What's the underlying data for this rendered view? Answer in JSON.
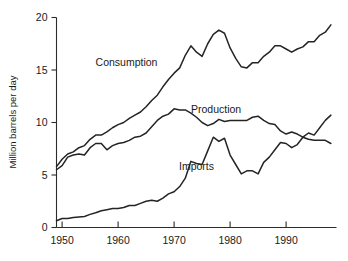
{
  "chart_data": {
    "type": "line",
    "title": "",
    "xlabel": "",
    "ylabel": "Million barrels per day",
    "xlim": [
      1949,
      1999
    ],
    "ylim": [
      0,
      20
    ],
    "grid": false,
    "legend_position": "inline-annotations",
    "xticks": [
      1950,
      1960,
      1970,
      1980,
      1990
    ],
    "yticks": [
      0,
      5,
      10,
      15,
      20
    ],
    "xtick_labels": [
      "1950",
      "1960",
      "1970",
      "1980",
      "1990"
    ],
    "ytick_labels": [
      "0",
      "5",
      "10",
      "15",
      "20"
    ],
    "annotations": [
      {
        "text": "Consumption",
        "x": 1961.5,
        "y": 15.4
      },
      {
        "text": "Production",
        "x": 1977.5,
        "y": 10.9
      },
      {
        "text": "Imports",
        "x": 1974.0,
        "y": 5.5
      }
    ],
    "series": [
      {
        "name": "Consumption",
        "color": "#242424",
        "x": [
          1949,
          1950,
          1951,
          1952,
          1953,
          1954,
          1955,
          1956,
          1957,
          1958,
          1959,
          1960,
          1961,
          1962,
          1963,
          1964,
          1965,
          1966,
          1967,
          1968,
          1969,
          1970,
          1971,
          1972,
          1973,
          1974,
          1975,
          1976,
          1977,
          1978,
          1979,
          1980,
          1981,
          1982,
          1983,
          1984,
          1985,
          1986,
          1987,
          1988,
          1989,
          1990,
          1991,
          1992,
          1993,
          1994,
          1995,
          1996,
          1997,
          1998
        ],
        "values": [
          5.8,
          6.5,
          7.0,
          7.2,
          7.6,
          7.8,
          8.4,
          8.8,
          8.8,
          9.1,
          9.5,
          9.8,
          10.0,
          10.4,
          10.7,
          11.0,
          11.5,
          12.1,
          12.6,
          13.4,
          14.1,
          14.7,
          15.2,
          16.4,
          17.3,
          16.7,
          16.3,
          17.5,
          18.4,
          18.8,
          18.5,
          17.1,
          16.1,
          15.3,
          15.2,
          15.7,
          15.7,
          16.3,
          16.7,
          17.3,
          17.3,
          17.0,
          16.7,
          17.0,
          17.2,
          17.7,
          17.7,
          18.3,
          18.6,
          19.3
        ]
      },
      {
        "name": "Production",
        "color": "#242424",
        "x": [
          1949,
          1950,
          1951,
          1952,
          1953,
          1954,
          1955,
          1956,
          1957,
          1958,
          1959,
          1960,
          1961,
          1962,
          1963,
          1964,
          1965,
          1966,
          1967,
          1968,
          1969,
          1970,
          1971,
          1972,
          1973,
          1974,
          1975,
          1976,
          1977,
          1978,
          1979,
          1980,
          1981,
          1982,
          1983,
          1984,
          1985,
          1986,
          1987,
          1988,
          1989,
          1990,
          1991,
          1992,
          1993,
          1994,
          1995,
          1996,
          1997,
          1998
        ],
        "values": [
          5.5,
          5.9,
          6.7,
          6.9,
          7.0,
          6.9,
          7.6,
          8.0,
          8.0,
          7.4,
          7.8,
          8.0,
          8.1,
          8.3,
          8.6,
          8.7,
          9.0,
          9.6,
          10.2,
          10.6,
          10.8,
          11.3,
          11.2,
          11.2,
          10.9,
          10.5,
          10.0,
          9.7,
          9.9,
          10.3,
          10.1,
          10.2,
          10.2,
          10.2,
          10.2,
          10.5,
          10.6,
          10.2,
          9.9,
          9.8,
          9.2,
          8.9,
          9.1,
          8.9,
          8.6,
          8.4,
          8.3,
          8.3,
          8.3,
          8.0
        ]
      },
      {
        "name": "Imports",
        "color": "#242424",
        "x": [
          1949,
          1950,
          1951,
          1952,
          1953,
          1954,
          1955,
          1956,
          1957,
          1958,
          1959,
          1960,
          1961,
          1962,
          1963,
          1964,
          1965,
          1966,
          1967,
          1968,
          1969,
          1970,
          1971,
          1972,
          1973,
          1974,
          1975,
          1976,
          1977,
          1978,
          1979,
          1980,
          1981,
          1982,
          1983,
          1984,
          1985,
          1986,
          1987,
          1988,
          1989,
          1990,
          1991,
          1992,
          1993,
          1994,
          1995,
          1996,
          1997,
          1998
        ],
        "values": [
          0.65,
          0.85,
          0.85,
          0.95,
          1.0,
          1.05,
          1.25,
          1.4,
          1.6,
          1.7,
          1.8,
          1.8,
          1.9,
          2.1,
          2.1,
          2.3,
          2.5,
          2.6,
          2.5,
          2.8,
          3.2,
          3.4,
          3.9,
          4.7,
          6.3,
          6.1,
          6.0,
          7.3,
          8.6,
          8.2,
          8.5,
          6.9,
          6.0,
          5.1,
          5.4,
          5.4,
          5.1,
          6.2,
          6.7,
          7.4,
          8.1,
          8.0,
          7.6,
          7.9,
          8.6,
          9.0,
          8.8,
          9.5,
          10.2,
          10.7
        ]
      }
    ]
  }
}
